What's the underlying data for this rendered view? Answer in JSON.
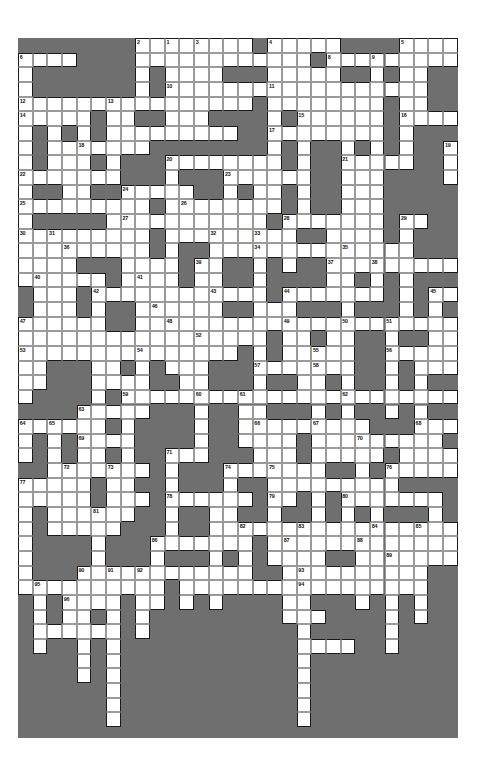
{
  "document": {
    "type": "crossword-puzzle",
    "title": "Crossword Puzzle Grid",
    "page_background": "#ffffff"
  },
  "grid": {
    "columns": 30,
    "rows": 47,
    "cell_size": 14.66,
    "origin_x": 18,
    "origin_y": 38,
    "frame_width": 440,
    "frame_height": 700,
    "colors": {
      "block": "#6f6f6f",
      "cell": "#ffffff",
      "cell_border": "#9a9a9a",
      "entry_border": "#1a1a1a",
      "number": "#111111"
    },
    "numbers_total": 96,
    "clue_numbers": [
      1,
      2,
      3,
      4,
      5,
      6,
      7,
      8,
      9,
      10,
      11,
      12,
      13,
      14,
      15,
      16,
      17,
      18,
      19,
      20,
      21,
      22,
      23,
      24,
      25,
      26,
      27,
      28,
      29,
      30,
      31,
      32,
      33,
      34,
      35,
      36,
      37,
      38,
      39,
      40,
      41,
      42,
      43,
      44,
      45,
      46,
      47,
      48,
      49,
      50,
      51,
      52,
      53,
      54,
      55,
      56,
      57,
      58,
      59,
      60,
      61,
      62,
      63,
      64,
      65,
      66,
      67,
      68,
      69,
      70,
      71,
      72,
      73,
      74,
      75,
      76,
      77,
      78,
      79,
      80,
      81,
      82,
      83,
      84,
      85,
      86,
      87,
      88,
      89,
      90,
      91,
      92,
      93,
      94,
      95,
      96
    ],
    "cells": [
      [
        11,
        1,
        "1"
      ],
      [
        11,
        2,
        null
      ],
      [
        11,
        3,
        null
      ],
      [
        11,
        4,
        null
      ],
      [
        11,
        5,
        null
      ],
      [
        11,
        6,
        null
      ],
      [
        11,
        7,
        null
      ],
      [
        1,
        2,
        "6"
      ],
      [
        2,
        2,
        null
      ],
      [
        3,
        2,
        null
      ],
      [
        12,
        2,
        null
      ],
      [
        9,
        1,
        "2"
      ],
      [
        9,
        2,
        null
      ],
      [
        9,
        3,
        null
      ],
      [
        9,
        4,
        null
      ],
      [
        13,
        1,
        "3"
      ],
      [
        13,
        2,
        null
      ],
      [
        13,
        3,
        null
      ],
      [
        13,
        4,
        null
      ],
      [
        13,
        5,
        null
      ],
      [
        13,
        6,
        null
      ],
      [
        13,
        7,
        null
      ],
      [
        18,
        1,
        "4"
      ],
      [
        18,
        2,
        null
      ],
      [
        18,
        3,
        null
      ],
      [
        18,
        4,
        null
      ],
      [
        18,
        5,
        null
      ],
      [
        18,
        6,
        null
      ],
      [
        18,
        7,
        null
      ],
      [
        18,
        8,
        null
      ],
      [
        18,
        9,
        null
      ],
      [
        18,
        10,
        null
      ],
      [
        27,
        1,
        "5"
      ],
      [
        27,
        2,
        null
      ],
      [
        27,
        3,
        null
      ],
      [
        27,
        4,
        null
      ],
      [
        27,
        5,
        null
      ],
      [
        27,
        6,
        null
      ],
      [
        27,
        7,
        null
      ],
      [
        27,
        8,
        null
      ],
      [
        10,
        2,
        null
      ],
      [
        11,
        2,
        null
      ],
      [
        12,
        2,
        null
      ],
      [
        14,
        2,
        null
      ],
      [
        15,
        2,
        null
      ],
      [
        16,
        2,
        null
      ],
      [
        17,
        2,
        null
      ],
      [
        19,
        2,
        null
      ],
      [
        20,
        2,
        null
      ],
      [
        22,
        2,
        "8"
      ],
      [
        22,
        3,
        null
      ],
      [
        22,
        4,
        null
      ],
      [
        25,
        2,
        "9"
      ],
      [
        26,
        2,
        null
      ],
      [
        28,
        2,
        null
      ],
      [
        29,
        2,
        null
      ],
      [
        25,
        3,
        null
      ],
      [
        25,
        4,
        null
      ],
      [
        25,
        5,
        null
      ],
      [
        25,
        6,
        null
      ],
      [
        25,
        7,
        null
      ],
      [
        25,
        8,
        null
      ],
      [
        11,
        4,
        "10"
      ],
      [
        12,
        4,
        null
      ],
      [
        18,
        4,
        "11"
      ],
      [
        19,
        4,
        null
      ],
      [
        20,
        4,
        null
      ],
      [
        21,
        4,
        null
      ],
      [
        22,
        4,
        null
      ],
      [
        23,
        4,
        null
      ],
      [
        24,
        4,
        null
      ],
      [
        25,
        4,
        null
      ],
      [
        1,
        5,
        "12"
      ],
      [
        7,
        5,
        "13"
      ],
      [
        8,
        5,
        null
      ],
      [
        9,
        5,
        null
      ],
      [
        10,
        5,
        null
      ],
      [
        11,
        5,
        null
      ],
      [
        12,
        5,
        null
      ],
      [
        13,
        5,
        null
      ],
      [
        1,
        6,
        "14"
      ],
      [
        2,
        6,
        null
      ],
      [
        3,
        6,
        null
      ],
      [
        4,
        6,
        null
      ],
      [
        5,
        6,
        null
      ],
      [
        20,
        6,
        "15"
      ],
      [
        20,
        7,
        null
      ],
      [
        20,
        8,
        null
      ],
      [
        27,
        6,
        "16"
      ],
      [
        27,
        7,
        null
      ],
      [
        27,
        8,
        null
      ],
      [
        27,
        9,
        null
      ],
      [
        18,
        7,
        "17"
      ],
      [
        19,
        7,
        null
      ],
      [
        20,
        7,
        null
      ],
      [
        21,
        7,
        null
      ],
      [
        22,
        7,
        null
      ],
      [
        1,
        7,
        null
      ],
      [
        1,
        8,
        null
      ],
      [
        1,
        9,
        null
      ],
      [
        5,
        7,
        null
      ],
      [
        5,
        8,
        null
      ],
      [
        5,
        8,
        "18"
      ],
      [
        6,
        8,
        null
      ],
      [
        7,
        8,
        null
      ],
      [
        30,
        8,
        "19"
      ],
      [
        11,
        9,
        "20"
      ],
      [
        12,
        9,
        null
      ],
      [
        13,
        9,
        null
      ],
      [
        14,
        9,
        null
      ],
      [
        15,
        9,
        null
      ],
      [
        16,
        9,
        null
      ],
      [
        17,
        9,
        null
      ],
      [
        23,
        9,
        "21"
      ],
      [
        24,
        9,
        null
      ],
      [
        25,
        9,
        null
      ],
      [
        26,
        9,
        null
      ],
      [
        27,
        9,
        null
      ],
      [
        1,
        10,
        "22"
      ],
      [
        2,
        10,
        null
      ],
      [
        3,
        10,
        null
      ],
      [
        15,
        10,
        "23"
      ],
      [
        16,
        10,
        null
      ],
      [
        17,
        10,
        null
      ],
      [
        18,
        10,
        null
      ],
      [
        19,
        10,
        null
      ],
      [
        8,
        11,
        "24"
      ],
      [
        1,
        12,
        "25"
      ],
      [
        2,
        12,
        null
      ],
      [
        3,
        12,
        null
      ],
      [
        4,
        12,
        null
      ],
      [
        5,
        12,
        null
      ],
      [
        12,
        12,
        "26"
      ],
      [
        13,
        12,
        null
      ],
      [
        14,
        12,
        null
      ],
      [
        8,
        13,
        "27"
      ],
      [
        9,
        13,
        null
      ],
      [
        10,
        13,
        null
      ],
      [
        11,
        13,
        null
      ],
      [
        19,
        13,
        "28"
      ],
      [
        20,
        13,
        null
      ],
      [
        21,
        13,
        null
      ],
      [
        22,
        13,
        null
      ],
      [
        23,
        13,
        null
      ],
      [
        24,
        13,
        null
      ],
      [
        27,
        13,
        "29"
      ],
      [
        1,
        14,
        "30"
      ],
      [
        3,
        14,
        "31"
      ],
      [
        4,
        14,
        null
      ],
      [
        5,
        14,
        null
      ],
      [
        6,
        14,
        null
      ],
      [
        14,
        14,
        "32"
      ],
      [
        17,
        14,
        "33"
      ],
      [
        4,
        15,
        "36"
      ],
      [
        5,
        15,
        null
      ],
      [
        6,
        15,
        null
      ],
      [
        7,
        15,
        null
      ],
      [
        8,
        15,
        null
      ],
      [
        17,
        15,
        "34"
      ],
      [
        18,
        15,
        null
      ],
      [
        19,
        15,
        null
      ],
      [
        20,
        15,
        null
      ],
      [
        23,
        15,
        "35"
      ],
      [
        22,
        16,
        "37"
      ],
      [
        23,
        16,
        null
      ],
      [
        24,
        16,
        null
      ],
      [
        25,
        16,
        "38"
      ],
      [
        13,
        16,
        "39"
      ],
      [
        14,
        16,
        null
      ],
      [
        2,
        17,
        "40"
      ],
      [
        3,
        17,
        null
      ],
      [
        4,
        17,
        null
      ],
      [
        5,
        17,
        null
      ],
      [
        6,
        17,
        null
      ],
      [
        9,
        17,
        "41"
      ],
      [
        6,
        18,
        "42"
      ],
      [
        7,
        18,
        null
      ],
      [
        8,
        18,
        null
      ],
      [
        14,
        18,
        "43"
      ],
      [
        15,
        18,
        null
      ],
      [
        19,
        18,
        "44"
      ],
      [
        20,
        18,
        null
      ],
      [
        29,
        18,
        "45"
      ],
      [
        10,
        19,
        "46"
      ],
      [
        1,
        20,
        "47"
      ],
      [
        2,
        20,
        null
      ],
      [
        3,
        20,
        null
      ],
      [
        4,
        20,
        null
      ],
      [
        5,
        20,
        null
      ],
      [
        11,
        20,
        "48"
      ],
      [
        19,
        20,
        "49"
      ],
      [
        20,
        20,
        null
      ],
      [
        23,
        20,
        "50"
      ],
      [
        26,
        20,
        "51"
      ],
      [
        13,
        21,
        "52"
      ],
      [
        1,
        22,
        "53"
      ],
      [
        2,
        22,
        null
      ],
      [
        3,
        22,
        null
      ],
      [
        9,
        22,
        "54"
      ],
      [
        10,
        22,
        null
      ],
      [
        21,
        22,
        "55"
      ],
      [
        26,
        22,
        "56"
      ],
      [
        17,
        23,
        "57"
      ],
      [
        18,
        23,
        null
      ],
      [
        21,
        23,
        "58"
      ],
      [
        8,
        25,
        "59"
      ],
      [
        13,
        25,
        "60"
      ],
      [
        16,
        25,
        "61"
      ],
      [
        23,
        25,
        "62"
      ],
      [
        5,
        26,
        "63"
      ],
      [
        1,
        27,
        "64"
      ],
      [
        3,
        27,
        "65"
      ],
      [
        17,
        27,
        "66"
      ],
      [
        21,
        27,
        "67"
      ],
      [
        28,
        27,
        "68"
      ],
      [
        5,
        28,
        "69"
      ],
      [
        24,
        28,
        "70"
      ],
      [
        11,
        29,
        "71"
      ],
      [
        4,
        30,
        "72"
      ],
      [
        7,
        30,
        "73"
      ],
      [
        15,
        30,
        "74"
      ],
      [
        18,
        30,
        "75"
      ],
      [
        26,
        30,
        "76"
      ],
      [
        1,
        31,
        "77"
      ],
      [
        11,
        32,
        "78"
      ],
      [
        18,
        32,
        "79"
      ],
      [
        23,
        32,
        "80"
      ],
      [
        6,
        33,
        "81"
      ],
      [
        16,
        34,
        "82"
      ],
      [
        20,
        34,
        "83"
      ],
      [
        25,
        34,
        "84"
      ],
      [
        28,
        34,
        "85"
      ],
      [
        10,
        35,
        "86"
      ],
      [
        19,
        35,
        "87"
      ],
      [
        24,
        35,
        "88"
      ],
      [
        26,
        36,
        "89"
      ],
      [
        5,
        37,
        "90"
      ],
      [
        7,
        37,
        "91"
      ],
      [
        9,
        37,
        "92"
      ],
      [
        20,
        37,
        "93"
      ],
      [
        20,
        38,
        "94"
      ],
      [
        2,
        38,
        "95"
      ],
      [
        4,
        39,
        "96"
      ]
    ]
  }
}
